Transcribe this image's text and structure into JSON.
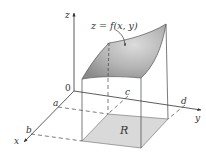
{
  "diagram": {
    "surface_label": "z = f(x, y)",
    "region_label": "R",
    "origin_label": "0",
    "axes": {
      "x": "x",
      "y": "y",
      "z": "z"
    },
    "bounds": {
      "a": "a",
      "b": "b",
      "c": "c",
      "d": "d"
    },
    "colors": {
      "surface_fill": "#9a9a9a",
      "surface_highlight": "#d6d6d6",
      "region_fill": "#d9d9d9",
      "line": "#4a4a4a"
    }
  }
}
